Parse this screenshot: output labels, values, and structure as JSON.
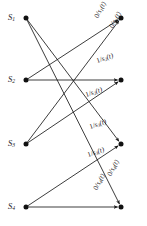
{
  "figure": {
    "kind": "bipartite-transition-diagram",
    "width": 147,
    "height": 226,
    "background": "#ffffff",
    "line_color": "#1a1a1a",
    "node_color": "#111111",
    "text_color": "#171717"
  },
  "source_nodes": [
    {
      "id": "s1",
      "label": "S",
      "sub": "1",
      "x": 26,
      "y": 18
    },
    {
      "id": "s2",
      "label": "S",
      "sub": "2",
      "x": 26,
      "y": 80
    },
    {
      "id": "s3",
      "label": "S",
      "sub": "3",
      "x": 26,
      "y": 144
    },
    {
      "id": "s4",
      "label": "S",
      "sub": "4",
      "x": 26,
      "y": 207
    }
  ],
  "dest_nodes": [
    {
      "id": "d1",
      "x": 121,
      "y": 18
    },
    {
      "id": "d2",
      "x": 121,
      "y": 80
    },
    {
      "id": "d3",
      "x": 121,
      "y": 144
    },
    {
      "id": "d4",
      "x": 121,
      "y": 207
    }
  ],
  "edges": [
    {
      "id": "e1",
      "from": "s1",
      "to": "d3",
      "from_x": 26,
      "from_y": 18,
      "to_x": 121,
      "to_y": 144
    },
    {
      "id": "e2",
      "from": "s1",
      "to": "d4",
      "from_x": 26,
      "from_y": 18,
      "to_x": 121,
      "to_y": 207
    },
    {
      "id": "e3",
      "from": "s2",
      "to": "d2",
      "from_x": 26,
      "from_y": 80,
      "to_x": 121,
      "to_y": 80
    },
    {
      "id": "e4",
      "from": "s2",
      "to": "d1",
      "from_x": 26,
      "from_y": 80,
      "to_x": 121,
      "to_y": 18
    },
    {
      "id": "e5",
      "from": "s3",
      "to": "d1",
      "from_x": 26,
      "from_y": 144,
      "to_x": 121,
      "to_y": 18
    },
    {
      "id": "e6",
      "from": "s3",
      "to": "d2",
      "from_x": 26,
      "from_y": 144,
      "to_x": 121,
      "to_y": 80
    },
    {
      "id": "e7",
      "from": "s4",
      "to": "d3",
      "from_x": 26,
      "from_y": 207,
      "to_x": 121,
      "to_y": 144
    },
    {
      "id": "e8",
      "from": "s4",
      "to": "d4",
      "from_x": 26,
      "from_y": 207,
      "to_x": 121,
      "to_y": 207
    }
  ],
  "edge_labels": [
    {
      "id": "l1",
      "input": "0",
      "sep": "/",
      "sig": "s",
      "sub": "1",
      "arg": "(t)",
      "x": 97,
      "y": 14,
      "rotate": -62
    },
    {
      "id": "l2",
      "input": "0",
      "sep": "/",
      "sig": "s",
      "sub": "1",
      "arg": "(t)",
      "x": 112,
      "y": 24,
      "rotate": -62
    },
    {
      "id": "l3",
      "input": "1",
      "sep": "/",
      "sig": "s",
      "sub": "2",
      "arg": "(t)",
      "x": 97,
      "y": 58,
      "rotate": -19
    },
    {
      "id": "l4",
      "input": "1",
      "sep": "/",
      "sig": "s",
      "sub": "2",
      "arg": "(t)",
      "x": 86,
      "y": 92,
      "rotate": -19
    },
    {
      "id": "l5",
      "input": "1",
      "sep": "/",
      "sig": "s",
      "sub": "3",
      "arg": "(t)",
      "x": 90,
      "y": 124,
      "rotate": -19
    },
    {
      "id": "l6",
      "input": "1",
      "sep": "/",
      "sig": "s",
      "sub": "3",
      "arg": "(t)",
      "x": 88,
      "y": 152,
      "rotate": -19
    },
    {
      "id": "l7",
      "input": "0",
      "sep": "/",
      "sig": "s",
      "sub": "4",
      "arg": "(t)",
      "x": 110,
      "y": 172,
      "rotate": -62
    },
    {
      "id": "l8",
      "input": "0",
      "sep": "/",
      "sig": "s",
      "sub": "4",
      "arg": "(t)",
      "x": 96,
      "y": 186,
      "rotate": -62
    }
  ]
}
